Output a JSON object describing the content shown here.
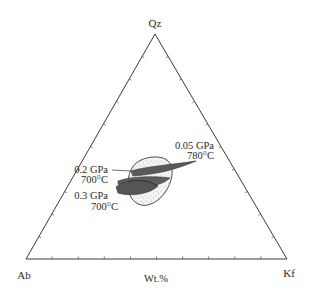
{
  "chart_data": {
    "type": "ternary",
    "title": "",
    "vertices": {
      "top": "Qz",
      "left": "Ab",
      "right": "Kf"
    },
    "axis_label": "Wt.%",
    "tick_interval_percent": 10,
    "grid": false,
    "fields": [
      {
        "name": "0.05 GPa, 780°C",
        "pressure": "0.05 GPa",
        "temperature": "780°C",
        "style": "shaded dark gray, elongated",
        "approx_composition_Qz_Ab_Kf": [
          40,
          30,
          30
        ]
      },
      {
        "name": "0.2 GPa, 700°C",
        "pressure": "0.2 GPa",
        "temperature": "700°C",
        "style": "shaded dark gray, lens",
        "approx_composition_Qz_Ab_Kf": [
          36,
          38,
          26
        ]
      },
      {
        "name": "0.3 GPa, 700°C",
        "pressure": "0.3 GPa",
        "temperature": "700°C",
        "style": "shaded dark gray, lens",
        "approx_composition_Qz_Ab_Kf": [
          34,
          41,
          25
        ]
      },
      {
        "name": "granite field",
        "style": "dotted outline with stippled interior",
        "approx_composition_Qz_Ab_Kf": [
          33,
          36,
          31
        ]
      }
    ]
  },
  "labels": {
    "qz": "Qz",
    "ab": "Ab",
    "kf": "Kf",
    "axis": "Wt.%",
    "f1_pressure": "0.05 GPa",
    "f1_temp": "780°C",
    "f2_pressure": "0.2 GPa",
    "f2_temp": "700°C",
    "f3_pressure": "0.3 GPa",
    "f3_temp": "700°C"
  },
  "colors": {
    "shade": "#5a5a5a",
    "outline": "#3a3a3a",
    "stipple_fill": "#f1f1f1"
  }
}
